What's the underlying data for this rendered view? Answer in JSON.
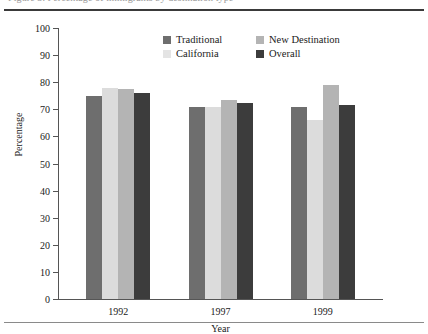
{
  "caption": {
    "text": "Figure 3. Percentage of immigrants by destination type"
  },
  "chart_data": {
    "type": "bar",
    "title": "",
    "xlabel": "Year",
    "ylabel": "Percentage",
    "categories": [
      "1992",
      "1997",
      "1999"
    ],
    "ylim": [
      0,
      100
    ],
    "yticks": [
      0,
      10,
      20,
      30,
      40,
      50,
      60,
      70,
      80,
      90,
      100
    ],
    "ytick_labels": [
      "0",
      "10",
      "20",
      "30",
      "40",
      "50",
      "60",
      "70",
      "80",
      "90",
      "100"
    ],
    "grid": false,
    "legend_position": "top-center",
    "series": [
      {
        "name": "Traditional",
        "color": "#6e6e6e",
        "values": [
          75,
          71,
          71
        ]
      },
      {
        "name": "California",
        "color": "#e4e4e4",
        "values": [
          78,
          71,
          66
        ]
      },
      {
        "name": "New Destination",
        "color": "#b4b4b4",
        "values": [
          77.5,
          73.5,
          79
        ]
      },
      {
        "name": "Overall",
        "color": "#3c3c3c",
        "values": [
          76,
          72.5,
          71.5
        ]
      }
    ]
  },
  "legend": {
    "items": [
      {
        "label": "Traditional"
      },
      {
        "label": "New Destination"
      },
      {
        "label": "California"
      },
      {
        "label": "Overall"
      }
    ]
  }
}
